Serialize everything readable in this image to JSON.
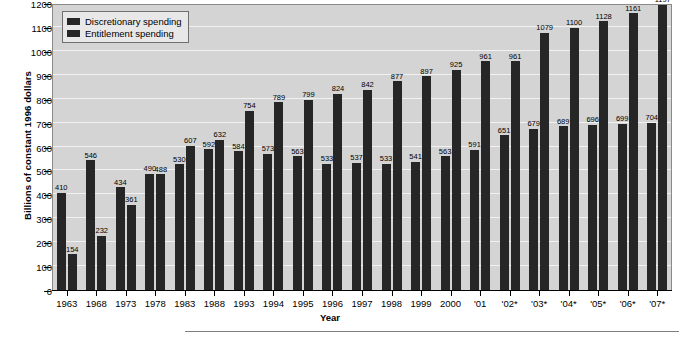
{
  "chart_data": {
    "type": "bar",
    "title": "",
    "xlabel": "Year",
    "ylabel": "Billions of constant 1996 dollars",
    "ylim": [
      0,
      1200
    ],
    "yticks": [
      0,
      100,
      200,
      300,
      400,
      500,
      600,
      700,
      800,
      900,
      1000,
      1100,
      1200
    ],
    "grid": true,
    "legend_position": "top-left",
    "bar_color": "#262626",
    "plot_background": "#d4d4d4",
    "gridline_color": "#f2f2f2",
    "categories": [
      "1963",
      "1968",
      "1973",
      "1978",
      "1983",
      "1988",
      "1993",
      "1994",
      "1995",
      "1996",
      "1997",
      "1998",
      "1999",
      "2000",
      "'01",
      "'02*",
      "'03*",
      "'04*",
      "'05*",
      "'06*",
      "'07*"
    ],
    "series": [
      {
        "name": "Discretionary spending",
        "values": [
          410,
          546,
          434,
          490,
          530,
          592,
          584,
          573,
          563,
          533,
          537,
          533,
          541,
          563,
          591,
          651,
          679,
          689,
          696,
          699,
          704
        ]
      },
      {
        "name": "Entitlement spending",
        "values": [
          154,
          232,
          361,
          488,
          607,
          632,
          754,
          789,
          799,
          824,
          842,
          877,
          897,
          925,
          961,
          961,
          1079,
          1100,
          1128,
          1161,
          1197
        ]
      }
    ]
  },
  "legend": {
    "items": [
      {
        "label": "Discretionary spending"
      },
      {
        "label": "Entitlement spending"
      }
    ]
  },
  "axes": {
    "y_title": "Billions of constant 1996 dollars",
    "x_title": "Year"
  },
  "footer": {
    "note": ""
  }
}
